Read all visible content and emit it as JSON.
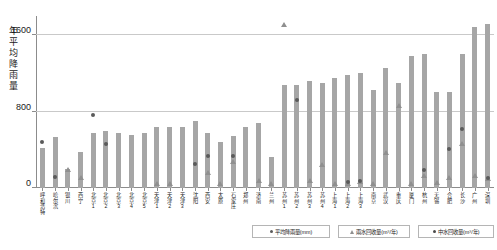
{
  "chart_data": {
    "type": "bar",
    "title": "",
    "xlabel": "",
    "ylabel": "年平均降雨量",
    "ylim": [
      0,
      1800
    ],
    "yticks": [
      0,
      800,
      1600
    ],
    "ytick_labels": [
      "0",
      "800",
      "1600"
    ],
    "grid": true,
    "legend_position": "bottom-right",
    "categories": [
      "呼和浩特",
      "哈尔滨",
      "银川",
      "西宁",
      "北京1",
      "北京2",
      "北京3",
      "北京4",
      "北京5",
      "天津1",
      "天津2",
      "天津3",
      "沈阳",
      "西安",
      "太原",
      "石家庄",
      "郑州",
      "济南",
      "兰州",
      "苏州1",
      "苏州2",
      "苏州3",
      "苏州4",
      "上海1",
      "上海2",
      "上海3",
      "南京",
      "武汉",
      "重庆",
      "厦门",
      "杭州",
      "无锡",
      "合肥",
      "长沙",
      "广州",
      "深圳"
    ],
    "series": [
      {
        "name": "平均降雨量(mm)",
        "type": "bar",
        "unit": "mm",
        "values": [
          420,
          530,
          200,
          380,
          580,
          600,
          580,
          560,
          580,
          640,
          640,
          640,
          700,
          580,
          480,
          540,
          640,
          680,
          320,
          1080,
          1080,
          1120,
          1100,
          1150,
          1180,
          1200,
          1030,
          1260,
          1100,
          1380,
          1400,
          1000,
          1000,
          1400,
          1680,
          1720
        ]
      },
      {
        "name": "雨水回收量(m³/年)",
        "type": "scatter",
        "unit": "m³/年",
        "values": [
          null,
          null,
          180,
          90,
          null,
          null,
          null,
          null,
          null,
          30,
          30,
          null,
          null,
          150,
          30,
          260,
          null,
          60,
          30,
          1700,
          null,
          60,
          230,
          30,
          30,
          50,
          30,
          360,
          850,
          30,
          120,
          40,
          90,
          450,
          120,
          80
        ]
      },
      {
        "name": "中水回收量(m³/年)",
        "type": "scatter",
        "unit": "m³/年",
        "values": [
          480,
          120,
          null,
          null,
          760,
          460,
          null,
          null,
          null,
          null,
          null,
          null,
          250,
          330,
          null,
          330,
          null,
          null,
          null,
          null,
          920,
          null,
          null,
          null,
          60,
          70,
          null,
          null,
          null,
          null,
          190,
          null,
          410,
          620,
          null,
          110
        ]
      }
    ]
  },
  "legend": [
    {
      "label": "平均降雨量(mm)",
      "marker": "dot-icon"
    },
    {
      "label": "雨水回收量(m³/年)",
      "marker": "triangle-icon"
    },
    {
      "label": "中水回收量(m³/年)",
      "marker": "dot-icon"
    }
  ]
}
